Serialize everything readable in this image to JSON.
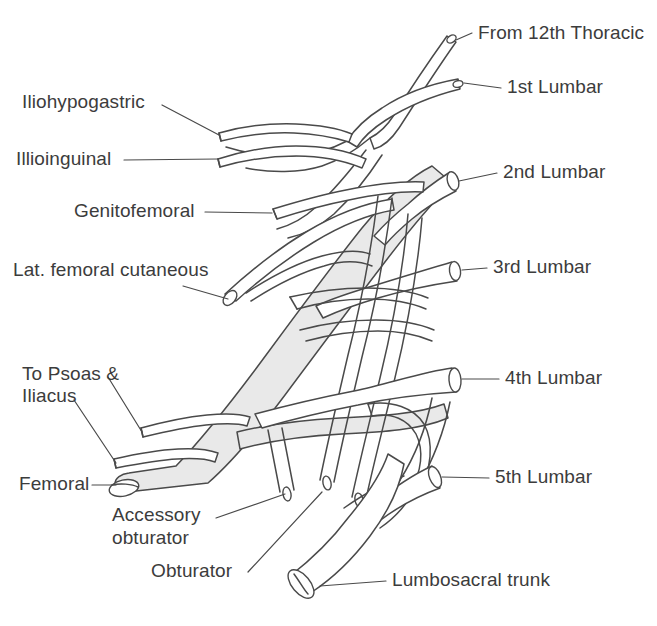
{
  "figure": {
    "background_color": "#ffffff",
    "ink_color": "#4a4a4a",
    "text_color": "#3c3c3c",
    "shading_color": "#e9e9e9"
  },
  "labels": {
    "from_12th_thoracic": "From 12th Thoracic",
    "first_lumbar": "1st Lumbar",
    "second_lumbar": "2nd Lumbar",
    "third_lumbar": "3rd Lumbar",
    "fourth_lumbar": "4th Lumbar",
    "fifth_lumbar": "5th Lumbar",
    "lumbosacral_trunk": "Lumbosacral trunk",
    "iliohypogastric": "Iliohypogastric",
    "illioinguinal": "Illioinguinal",
    "genitofemoral": "Genitofemoral",
    "lat_femoral_cutaneous": "Lat. femoral cutaneous",
    "to_psoas_and_iliacus_line1": "To Psoas &",
    "to_psoas_and_iliacus_line2": "Iliacus",
    "femoral": "Femoral",
    "accessory_obturator_line1": "Accessory",
    "accessory_obturator_line2": "obturator",
    "obturator": "Obturator"
  }
}
